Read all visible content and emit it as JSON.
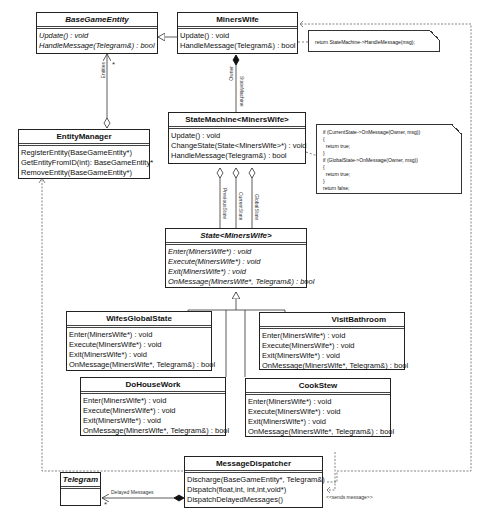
{
  "classes": {
    "base_game_entity": {
      "name": "BaseGameEntity",
      "methods": [
        "Update() : void",
        "HandleMessage(Telegram&) : bool"
      ]
    },
    "miners_wife": {
      "name": "MinersWife",
      "methods": [
        "Update() : void",
        "HandleMessage(Telegram&) : bool"
      ]
    },
    "entity_manager": {
      "name": "EntityManager",
      "methods": [
        "RegisterEntity(BaseGameEntity*)",
        "GetEntityFromID(int): BaseGameEntity*",
        "RemoveEntity(BaseGameEntity*)"
      ]
    },
    "state_machine": {
      "name": "StateMachine<MinersWife>",
      "methods": [
        "Update() : void",
        "ChangeState(State<MinersWife>*) : void",
        "HandleMessage(Telegram&) : bool"
      ]
    },
    "state": {
      "name": "State<MinersWife>",
      "methods": [
        "Enter(MinersWife*) : void",
        "Execute(MinersWife*) : void",
        "Exit(MinersWife*) : void",
        "OnMessage(MinersWife*, Telegram&) : bool"
      ]
    },
    "wifes_global_state": {
      "name": "WifesGlobalState",
      "methods": [
        "Enter(MinersWife*) : void",
        "Execute(MinersWife*) : void",
        "Exit(MinersWife*) : void",
        "OnMessage(MinersWife*, Telegram&) : bool"
      ]
    },
    "visit_bathroom": {
      "name": "VisitBathroom",
      "methods": [
        "Enter(MinersWife*) : void",
        "Execute(MinersWife*) : void",
        "Exit(MinersWife*) : void",
        "OnMessage(MinersWife*, Telegram&) : bool"
      ]
    },
    "do_house_work": {
      "name": "DoHouseWork",
      "methods": [
        "Enter(MinersWife*) : void",
        "Execute(MinersWife*) : void",
        "Exit(MinersWife*) : void",
        "OnMessage(MinersWife*, Telegram&) : bool"
      ]
    },
    "cook_stew": {
      "name": "CookStew",
      "methods": [
        "Enter(MinersWife*) : void",
        "Execute(MinersWife*) : void",
        "Exit(MinersWife*) : void",
        "OnMessage(MinersWife*, Telegram&) : bool"
      ]
    },
    "message_dispatcher": {
      "name": "MessageDispatcher",
      "methods": [
        "Discharge(BaseGameEntity*, Telegram&)",
        "Dispatch(float,int, int,int,void*)",
        "DispatchDelayedMessages()"
      ]
    },
    "telegram": {
      "name": "Telegram",
      "methods": []
    }
  },
  "notes": {
    "miners_wife_note": "return StateMachine->HandleMessage(msg);",
    "state_machine_note": "if (CurrentState->OnMessage(Owner, msg))\n{\n  return true;\n}\nif (GlobalState->OnMessage(Owner, msg))\n{\n  return true;\n}\nreturn false;"
  },
  "labels": {
    "entities": "Entities",
    "entities_mult": "*",
    "owner": "Owner",
    "state_machine_role": "StateMachine",
    "previous_state": "PreviousState",
    "current_state": "CurrentState",
    "global_state": "GlobalState",
    "delayed_messages": "Delayed Messages",
    "delayed_mult": "*",
    "sends_message": "<<sends message>>"
  }
}
